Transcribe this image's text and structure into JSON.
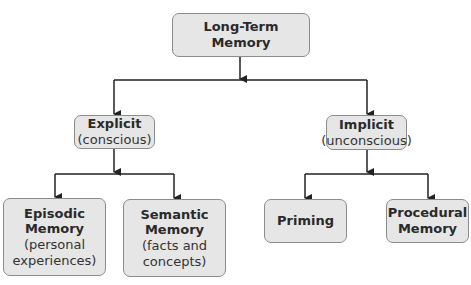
{
  "diagram": {
    "title": "Long-Term Memory",
    "nodes": [
      {
        "id": "ltm",
        "title": "Long-Term Memory",
        "subtitle": ""
      },
      {
        "id": "explicit",
        "title": "Explicit",
        "subtitle": "(conscious)"
      },
      {
        "id": "implicit",
        "title": "Implicit",
        "subtitle": "(unconscious)"
      },
      {
        "id": "episodic",
        "title": "Episodic Memory",
        "subtitle": "(personal experiences)"
      },
      {
        "id": "semantic",
        "title": "Semantic Memory",
        "subtitle": "(facts and concepts)"
      },
      {
        "id": "priming",
        "title": "Priming",
        "subtitle": ""
      },
      {
        "id": "procedural",
        "title": "Procedural Memory",
        "subtitle": ""
      }
    ],
    "edges": [
      {
        "from": "ltm",
        "to": "explicit"
      },
      {
        "from": "ltm",
        "to": "implicit"
      },
      {
        "from": "explicit",
        "to": "episodic"
      },
      {
        "from": "explicit",
        "to": "semantic"
      },
      {
        "from": "implicit",
        "to": "priming"
      },
      {
        "from": "implicit",
        "to": "procedural"
      }
    ],
    "colors": {
      "box_fill": "#e6e6e6",
      "box_border": "#8c8c8c",
      "line": "#222222"
    }
  },
  "labels": {
    "ltm": {
      "line1": "Long-Term Memory"
    },
    "explicit": {
      "line1": "Explicit",
      "line2": "(conscious)"
    },
    "implicit": {
      "line1": "Implicit",
      "line2": "(unconscious)"
    },
    "episodic": {
      "line1": "Episodic",
      "line2": "Memory",
      "line3": "(personal",
      "line4": "experiences)"
    },
    "semantic": {
      "line1": "Semantic",
      "line2": "Memory",
      "line3": "(facts and",
      "line4": "concepts)"
    },
    "priming": {
      "line1": "Priming"
    },
    "procedural": {
      "line1": "Procedural",
      "line2": "Memory"
    }
  }
}
